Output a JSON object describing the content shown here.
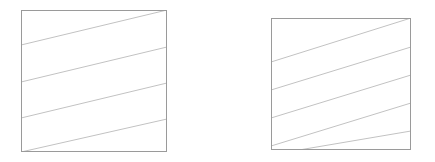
{
  "figure": {
    "width": 435,
    "height": 162,
    "background_color": "#ffffff"
  },
  "style": {
    "frame_stroke_color": "#9a9a9a",
    "frame_stroke_width": 1,
    "frame_fill_color": "#ffffff",
    "hatch_stroke_color": "#c2c2c2",
    "hatch_stroke_width": 1
  },
  "chart_data": {
    "type": "diagram",
    "panels": [
      {
        "name": "left-panel",
        "frame": {
          "x": 21,
          "y": 10,
          "width": 146,
          "height": 142
        },
        "hatch": {
          "line_count": 4,
          "direction": "lower-left to upper-right",
          "slope_dy_per_panel_width": -36,
          "spacing_px": 36,
          "lines": [
            {
              "x1": 21,
              "y1": 45,
              "x2": 167,
              "y2": 10
            },
            {
              "x1": 21,
              "y1": 82,
              "x2": 167,
              "y2": 47
            },
            {
              "x1": 21,
              "y1": 118,
              "x2": 167,
              "y2": 83
            },
            {
              "x1": 21,
              "y1": 152,
              "x2": 167,
              "y2": 119
            }
          ]
        }
      },
      {
        "name": "right-panel",
        "frame": {
          "x": 271,
          "y": 18,
          "width": 140,
          "height": 132
        },
        "hatch": {
          "line_count": 5,
          "direction": "lower-left to upper-right",
          "slope_dy_per_panel_width": -44,
          "spacing_px": 28,
          "lines": [
            {
              "x1": 271,
              "y1": 62,
              "x2": 411,
              "y2": 18
            },
            {
              "x1": 271,
              "y1": 90,
              "x2": 411,
              "y2": 47
            },
            {
              "x1": 271,
              "y1": 118,
              "x2": 411,
              "y2": 75
            },
            {
              "x1": 271,
              "y1": 146,
              "x2": 411,
              "y2": 103
            },
            {
              "x1": 299,
              "y1": 150,
              "x2": 411,
              "y2": 131
            }
          ]
        }
      }
    ]
  }
}
